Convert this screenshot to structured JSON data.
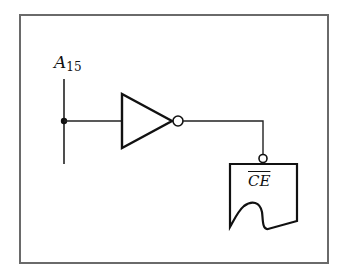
{
  "diagram": {
    "input_signal": {
      "name": "A",
      "subscript": "15"
    },
    "gate": {
      "type": "inverter"
    },
    "target": {
      "pin_label": "CE",
      "active_low": true
    },
    "colors": {
      "frame": "#6a6a6a",
      "line": "#111111",
      "background": "#ffffff"
    }
  }
}
